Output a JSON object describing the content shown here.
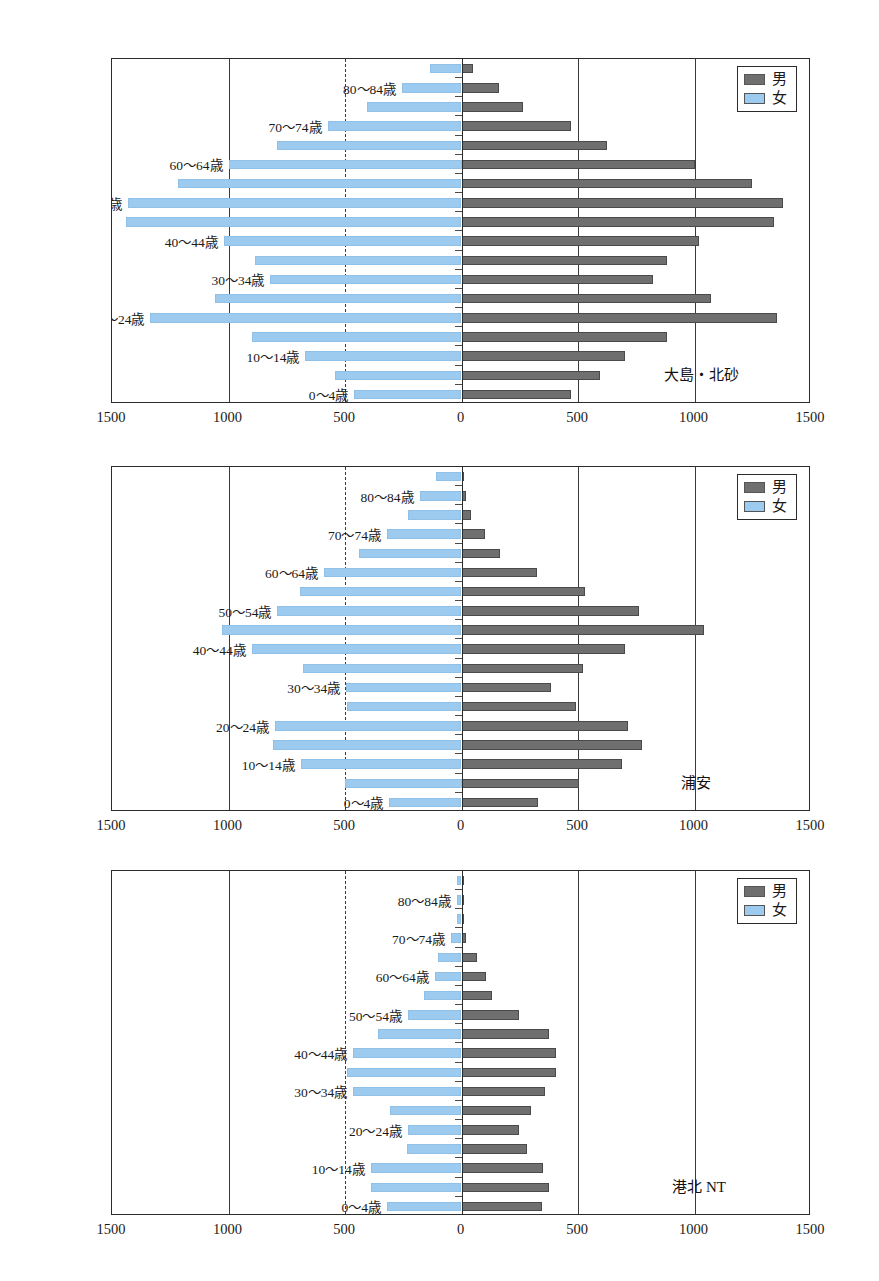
{
  "legend": {
    "male_label": "男",
    "female_label": "女",
    "male_color": "#6f6f6f",
    "female_color": "#9dcbf0"
  },
  "axis": {
    "ticks": [
      "1500",
      "1000",
      "500",
      "0",
      "500",
      "1000",
      "1500"
    ],
    "tick_values": [
      -1500,
      -1000,
      -500,
      0,
      500,
      1000,
      1500
    ],
    "min": -1500,
    "max": 1500
  },
  "age_groups": [
    "0～4歳",
    "5～9歳",
    "10～14歳",
    "15～19歳",
    "20～24歳",
    "25～29歳",
    "30～34歳",
    "35～39歳",
    "40～44歳",
    "45～49歳",
    "50～54歳",
    "55～59歳",
    "60～64歳",
    "65～69歳",
    "70～74歳",
    "75～79歳",
    "80～84歳",
    "85歳以上"
  ],
  "visible_age_labels": [
    "0～4歳",
    "10～14歳",
    "20～24歳",
    "30～34歳",
    "40～44歳",
    "50～54歳",
    "60～64歳",
    "70～74歳",
    "80～84歳"
  ],
  "chart_data": [
    {
      "type": "bar",
      "subtype": "population-pyramid",
      "title": "大島・北砂",
      "xlabel": "",
      "ylabel": "",
      "xlim": [
        -1500,
        1500
      ],
      "grid": true,
      "legend_position": "top-right",
      "categories": [
        "0～4歳",
        "5～9歳",
        "10～14歳",
        "15～19歳",
        "20～24歳",
        "25～29歳",
        "30～34歳",
        "35～39歳",
        "40～44歳",
        "45～49歳",
        "50～54歳",
        "55～59歳",
        "60～64歳",
        "65～69歳",
        "70～74歳",
        "75～79歳",
        "80～84歳",
        "85歳以上"
      ],
      "series": [
        {
          "name": "男",
          "values": [
            470,
            595,
            700,
            880,
            1355,
            1070,
            820,
            880,
            1020,
            1340,
            1380,
            1245,
            1000,
            625,
            470,
            265,
            160,
            50
          ]
        },
        {
          "name": "女",
          "values": [
            460,
            545,
            670,
            900,
            1335,
            1060,
            820,
            885,
            1020,
            1440,
            1430,
            1215,
            1000,
            790,
            575,
            405,
            255,
            135
          ]
        }
      ]
    },
    {
      "type": "bar",
      "subtype": "population-pyramid",
      "title": "浦安",
      "xlabel": "",
      "ylabel": "",
      "xlim": [
        -1500,
        1500
      ],
      "grid": true,
      "legend_position": "top-right",
      "categories": [
        "0～4歳",
        "5～9歳",
        "10～14歳",
        "15～19歳",
        "20～24歳",
        "25～29歳",
        "30～34歳",
        "35～39歳",
        "40～44歳",
        "45～49歳",
        "50～54歳",
        "55～59歳",
        "60～64歳",
        "65～69歳",
        "70～74歳",
        "75～79歳",
        "80～84歳",
        "85歳以上"
      ],
      "series": [
        {
          "name": "男",
          "values": [
            330,
            505,
            690,
            775,
            715,
            490,
            385,
            520,
            700,
            1040,
            760,
            530,
            325,
            165,
            100,
            40,
            20,
            5
          ]
        },
        {
          "name": "女",
          "values": [
            310,
            500,
            690,
            810,
            800,
            490,
            495,
            680,
            900,
            1030,
            790,
            695,
            590,
            440,
            320,
            230,
            180,
            110
          ]
        }
      ]
    },
    {
      "type": "bar",
      "subtype": "population-pyramid",
      "title": "港北 NT",
      "xlabel": "",
      "ylabel": "",
      "xlim": [
        -1500,
        1500
      ],
      "grid": true,
      "legend_position": "top-right",
      "categories": [
        "0～4歳",
        "5～9歳",
        "10～14歳",
        "15～19歳",
        "20～24歳",
        "25～29歳",
        "30～34歳",
        "35～39歳",
        "40～44歳",
        "45～49歳",
        "50～54歳",
        "55～59歳",
        "60～64歳",
        "65～69歳",
        "70～74歳",
        "75～79歳",
        "80～84歳",
        "85歳以上"
      ],
      "series": [
        {
          "name": "男",
          "values": [
            345,
            375,
            350,
            280,
            245,
            300,
            360,
            405,
            405,
            375,
            245,
            130,
            105,
            65,
            20,
            10,
            5,
            5
          ]
        },
        {
          "name": "女",
          "values": [
            320,
            390,
            390,
            235,
            230,
            305,
            465,
            490,
            465,
            360,
            230,
            160,
            115,
            100,
            45,
            20,
            20,
            20
          ]
        }
      ]
    }
  ]
}
